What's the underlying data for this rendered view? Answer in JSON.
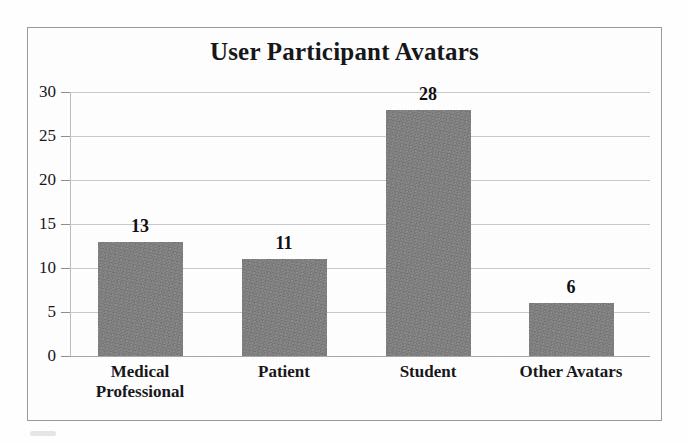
{
  "chart_data": {
    "type": "bar",
    "title": "User Participant Avatars",
    "xlabel": "",
    "ylabel": "",
    "categories": [
      "Medical Professional",
      "Patient",
      "Student",
      "Other Avatars"
    ],
    "category_lines": [
      [
        "Medical",
        "Professional"
      ],
      [
        "Patient"
      ],
      [
        "Student"
      ],
      [
        "Other Avatars"
      ]
    ],
    "values": [
      13,
      11,
      28,
      6
    ],
    "value_labels": [
      "13",
      "11",
      "28",
      "6"
    ],
    "ylim": [
      0,
      30
    ],
    "yticks": [
      0,
      5,
      10,
      15,
      20,
      25,
      30
    ],
    "ytick_labels": [
      "0",
      "5",
      "10",
      "15",
      "20",
      "25",
      "30"
    ],
    "grid": true,
    "grid_axis": "y",
    "legend": false,
    "legend_position": "none",
    "bar_color": "#808080",
    "grid_color": "#c9c9c9",
    "text_color": "#17171a",
    "frame_color": "#9a9a9a",
    "background": "#ffffff"
  }
}
